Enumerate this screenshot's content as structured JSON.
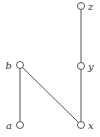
{
  "diagram": {
    "type": "hasse-diagram",
    "nodes": [
      {
        "id": "z",
        "label": "z",
        "x": 81,
        "y": 6,
        "label_dx": 7,
        "label_anchor": "start"
      },
      {
        "id": "y",
        "label": "y",
        "x": 81,
        "y": 66,
        "label_dx": 7,
        "label_anchor": "start"
      },
      {
        "id": "b",
        "label": "b",
        "x": 20,
        "y": 65,
        "label_dx": -8,
        "label_anchor": "end"
      },
      {
        "id": "a",
        "label": "a",
        "x": 20,
        "y": 125,
        "label_dx": -8,
        "label_anchor": "end"
      },
      {
        "id": "x",
        "label": "x",
        "x": 81,
        "y": 125,
        "label_dx": 7,
        "label_anchor": "start"
      }
    ],
    "edges": [
      {
        "from": "a",
        "to": "b"
      },
      {
        "from": "x",
        "to": "b"
      },
      {
        "from": "x",
        "to": "y"
      },
      {
        "from": "y",
        "to": "z"
      }
    ],
    "colors": {
      "line": "#555555",
      "node_fill": "#ffffff",
      "node_stroke": "#555555"
    }
  }
}
